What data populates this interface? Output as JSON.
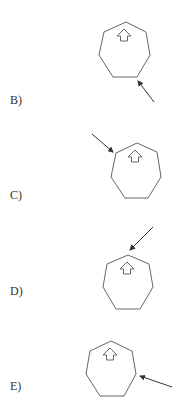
{
  "options": [
    {
      "label": "B)",
      "label_pos": [
        10,
        93
      ],
      "heptagon": [
        [
          126,
          22
        ],
        [
          146,
          32
        ],
        [
          150,
          55
        ],
        [
          137,
          77
        ],
        [
          113,
          77
        ],
        [
          99,
          55
        ],
        [
          104,
          32
        ]
      ],
      "inner_arrow": {
        "cx": 124,
        "top": 29
      },
      "pointer": {
        "from": [
          154,
          102
        ],
        "to": [
          138,
          81
        ]
      }
    },
    {
      "label": "C)",
      "label_pos": [
        10,
        188
      ],
      "heptagon": [
        [
          137,
          143
        ],
        [
          157,
          152
        ],
        [
          161,
          177
        ],
        [
          148,
          198
        ],
        [
          125,
          198
        ],
        [
          111,
          177
        ],
        [
          116,
          153
        ]
      ],
      "inner_arrow": {
        "cx": 135,
        "top": 150
      },
      "pointer": {
        "from": [
          92,
          134
        ],
        "to": [
          113,
          152
        ]
      }
    },
    {
      "label": "D)",
      "label_pos": [
        10,
        284
      ],
      "heptagon": [
        [
          128,
          255
        ],
        [
          149,
          264
        ],
        [
          153,
          287
        ],
        [
          140,
          309
        ],
        [
          116,
          309
        ],
        [
          103,
          287
        ],
        [
          107,
          264
        ]
      ],
      "inner_arrow": {
        "cx": 127,
        "top": 262
      },
      "pointer": {
        "from": [
          153,
          227
        ],
        "to": [
          130,
          250
        ]
      }
    },
    {
      "label": "E)",
      "label_pos": [
        10,
        379
      ],
      "heptagon": [
        [
          111,
          341
        ],
        [
          132,
          351
        ],
        [
          136,
          374
        ],
        [
          124,
          396
        ],
        [
          100,
          396
        ],
        [
          86,
          374
        ],
        [
          90,
          351
        ]
      ],
      "inner_arrow": {
        "cx": 110,
        "top": 348
      },
      "pointer": {
        "from": [
          172,
          387
        ],
        "to": [
          140,
          376
        ]
      }
    }
  ],
  "colors": {
    "outline": "#666666",
    "pointer": "#333333",
    "text": "#333333"
  }
}
